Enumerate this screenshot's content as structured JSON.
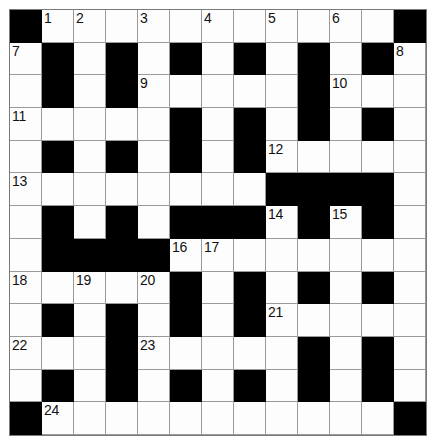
{
  "puzzle": {
    "title": "Crossword Grid",
    "rows": 13,
    "columns": 13,
    "cell_size_px": 32,
    "colors": {
      "block": "#000000",
      "cell": "#fdfdfd",
      "grid_line": "#9a9a9a",
      "number": "#111111",
      "page": "#ffffff"
    },
    "numbers_visible": [
      "1",
      "2",
      "3",
      "4",
      "5",
      "6",
      "7",
      "8",
      "9",
      "10",
      "11",
      "12",
      "13",
      "14",
      "15",
      "16",
      "17",
      "18",
      "19",
      "20",
      "21",
      "22",
      "23",
      "24"
    ],
    "legend": {
      "0": "white answer cell",
      "1": "black block cell"
    },
    "grid": [
      [
        1,
        0,
        0,
        0,
        0,
        0,
        0,
        0,
        0,
        0,
        0,
        0,
        1
      ],
      [
        0,
        1,
        0,
        1,
        0,
        1,
        0,
        1,
        0,
        1,
        0,
        1,
        0
      ],
      [
        0,
        1,
        0,
        1,
        0,
        0,
        0,
        0,
        0,
        1,
        0,
        0,
        0
      ],
      [
        0,
        0,
        0,
        0,
        0,
        1,
        0,
        1,
        0,
        1,
        0,
        1,
        0
      ],
      [
        0,
        1,
        0,
        1,
        0,
        1,
        0,
        1,
        0,
        0,
        0,
        0,
        0
      ],
      [
        0,
        0,
        0,
        0,
        0,
        0,
        0,
        0,
        1,
        1,
        1,
        1,
        0
      ],
      [
        0,
        1,
        0,
        1,
        0,
        1,
        1,
        1,
        0,
        1,
        0,
        1,
        0
      ],
      [
        0,
        1,
        1,
        1,
        1,
        0,
        0,
        0,
        0,
        0,
        0,
        0,
        0
      ],
      [
        0,
        0,
        0,
        0,
        0,
        1,
        0,
        1,
        0,
        1,
        0,
        1,
        0
      ],
      [
        0,
        1,
        0,
        1,
        0,
        1,
        0,
        1,
        0,
        0,
        0,
        0,
        0
      ],
      [
        0,
        0,
        0,
        1,
        0,
        0,
        0,
        0,
        0,
        1,
        0,
        1,
        0
      ],
      [
        0,
        1,
        0,
        1,
        0,
        1,
        0,
        1,
        0,
        1,
        0,
        1,
        0
      ],
      [
        1,
        0,
        0,
        0,
        0,
        0,
        0,
        0,
        0,
        0,
        0,
        0,
        1
      ]
    ],
    "numbered_cells": [
      {
        "number": "1",
        "row": 0,
        "col": 1
      },
      {
        "number": "2",
        "row": 0,
        "col": 2
      },
      {
        "number": "3",
        "row": 0,
        "col": 4
      },
      {
        "number": "4",
        "row": 0,
        "col": 6
      },
      {
        "number": "5",
        "row": 0,
        "col": 8
      },
      {
        "number": "6",
        "row": 0,
        "col": 10
      },
      {
        "number": "7",
        "row": 1,
        "col": 0
      },
      {
        "number": "8",
        "row": 1,
        "col": 12
      },
      {
        "number": "9",
        "row": 2,
        "col": 4
      },
      {
        "number": "10",
        "row": 2,
        "col": 10
      },
      {
        "number": "11",
        "row": 3,
        "col": 0
      },
      {
        "number": "12",
        "row": 4,
        "col": 8
      },
      {
        "number": "13",
        "row": 5,
        "col": 0
      },
      {
        "number": "14",
        "row": 6,
        "col": 8
      },
      {
        "number": "15",
        "row": 6,
        "col": 10
      },
      {
        "number": "16",
        "row": 7,
        "col": 5
      },
      {
        "number": "17",
        "row": 7,
        "col": 6
      },
      {
        "number": "18",
        "row": 8,
        "col": 0
      },
      {
        "number": "19",
        "row": 8,
        "col": 2
      },
      {
        "number": "20",
        "row": 8,
        "col": 4
      },
      {
        "number": "21",
        "row": 9,
        "col": 8
      },
      {
        "number": "22",
        "row": 10,
        "col": 0
      },
      {
        "number": "23",
        "row": 10,
        "col": 4
      },
      {
        "number": "24",
        "row": 12,
        "col": 1
      }
    ]
  }
}
